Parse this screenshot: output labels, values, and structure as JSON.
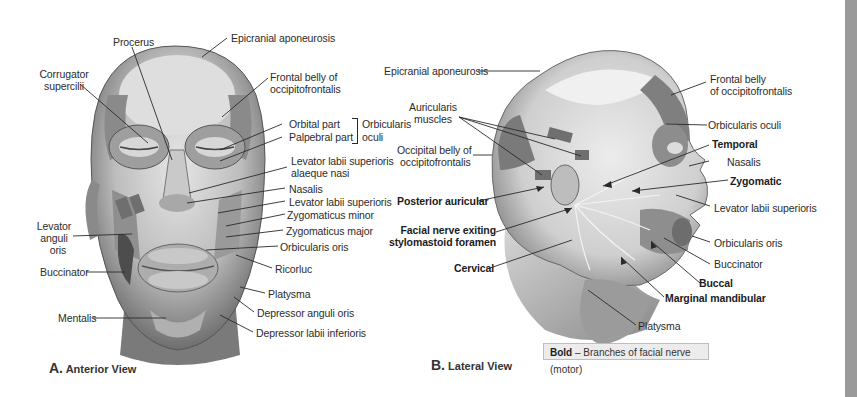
{
  "figure": {
    "panel_a": {
      "caption_letter": "A.",
      "caption_text": "Anterior View",
      "labels": {
        "procerus": "Procerus",
        "corrugator_1": "Corrugator",
        "corrugator_2": "supercilii",
        "epicranial": "Epicranial aponeurosis",
        "frontal_1": "Frontal belly of",
        "frontal_2": "occipitofrontalis",
        "orbital_part": "Orbital part",
        "palpebral_part": "Palpebral part",
        "orbicularis_oculi_1": "Orbicularis",
        "orbicularis_oculi_2": "oculi",
        "lev_alaeque_1": "Levator labii superioris",
        "lev_alaeque_2": "alaeque nasi",
        "nasalis": "Nasalis",
        "levator_labii_sup": "Levator labii superioris",
        "zyg_minor": "Zygomaticus minor",
        "zyg_major": "Zygomaticus major",
        "orbicularis_oris": "Orbicularis oris",
        "risorius": "Ricorluc",
        "platysma": "Platysma",
        "dep_anguli": "Depressor anguli oris",
        "dep_labii": "Depressor labii inferioris",
        "lev_anguli_1": "Levator",
        "lev_anguli_2": "anguli",
        "lev_anguli_3": "oris",
        "buccinator": "Buccinator",
        "mentalis": "Mentalis"
      }
    },
    "panel_b": {
      "caption_letter": "B.",
      "caption_text": "Lateral View",
      "labels": {
        "epicranial": "Epicranial aponeurosis",
        "auricularis_1": "Auricularis",
        "auricularis_2": "muscles",
        "occipital_1": "Occipital belly of",
        "occipital_2": "occipitofrontalis",
        "posterior_auricular": "Posterior auricular",
        "facial_exit_1": "Facial nerve exiting",
        "facial_exit_2": "stylomastoid foramen",
        "cervical": "Cervical",
        "frontal_1": "Frontal belly",
        "frontal_2": "of occipitofrontalis",
        "orbicularis_oculi": "Orbicularis oculi",
        "temporal": "Temporal",
        "nasalis": "Nasalis",
        "zygomatic": "Zygomatic",
        "levator_labii_sup": "Levator labii superioris",
        "orbicularis_oris": "Orbicularis oris",
        "buccinator": "Buccinator",
        "buccal": "Buccal",
        "marginal_mandibular": "Marginal mandibular",
        "platysma": "Platysma"
      },
      "legend": {
        "bold_word": "Bold",
        "dash": " – ",
        "text": "Branches of facial nerve (motor)"
      }
    },
    "colors": {
      "background": "#ffffff",
      "leader_line": "#2a2a2a",
      "legend_fill": "#ececec",
      "side_strip": "#9a9a9a"
    }
  }
}
